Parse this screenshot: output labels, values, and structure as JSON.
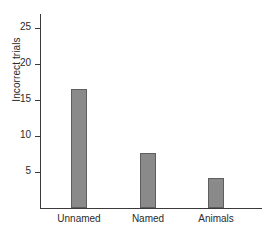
{
  "chart_data": {
    "type": "bar",
    "title": "",
    "xlabel": "",
    "ylabel": "Incorrect trials",
    "categories": [
      "Unnamed",
      "Named",
      "Animals"
    ],
    "values": [
      16.6,
      7.6,
      4.2
    ],
    "ylim": [
      0,
      27
    ],
    "yticks": [
      5,
      10,
      15,
      20,
      25
    ],
    "ytick_labels": [
      "5",
      "10",
      "15",
      "20",
      "25"
    ],
    "grid": false,
    "legend": false,
    "bar_color": "#8a8a8a",
    "bar_edge_color": "#5e5e5e",
    "axis_color": "#3a3a3a"
  }
}
